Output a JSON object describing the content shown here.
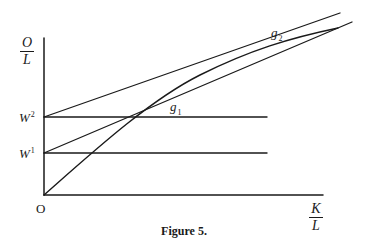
{
  "figure": {
    "caption": "Figure 5.",
    "stroke_color": "#1a1a1a",
    "background": "#ffffff"
  },
  "axes": {
    "y_label": {
      "numerator": "O",
      "denominator": "L"
    },
    "x_label": {
      "numerator": "K",
      "denominator": "L"
    },
    "origin_label": "O"
  },
  "levels": [
    {
      "id": "W1",
      "base": "W",
      "superscript": "1"
    },
    {
      "id": "W2",
      "base": "W",
      "superscript": "2"
    }
  ],
  "points": [
    {
      "id": "g1",
      "base": "g",
      "subscript": "1"
    },
    {
      "id": "g2",
      "base": "g",
      "subscript": "2"
    }
  ],
  "elements": {
    "curve": "concave production curve from origin",
    "ray_from_W1": "straight line from W1 tangent near g2",
    "ray_from_W2": "straight line from W2 tangent at g2",
    "horizontal_W1": "horizontal wage line at W1",
    "horizontal_W2": "horizontal wage line at W2"
  }
}
